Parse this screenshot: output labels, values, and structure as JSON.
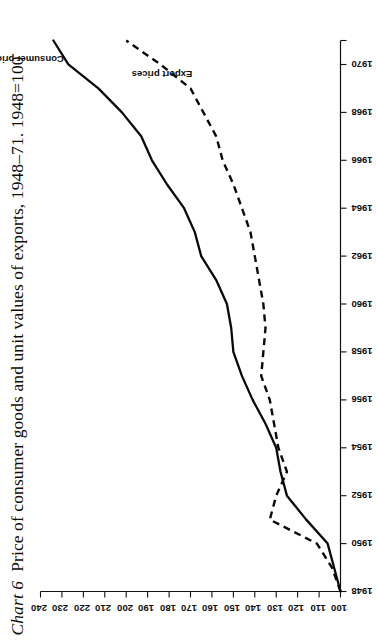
{
  "title": {
    "label": "Chart 6",
    "text": "Price of consumer goods and unit values of exports, 1948–71. 1948=100"
  },
  "series_labels": {
    "consumer": "Consumer prices",
    "export": "Export prices"
  },
  "axes": {
    "value_axis_ticks": [
      "240",
      "230",
      "220",
      "210",
      "200",
      "190",
      "180",
      "170",
      "160",
      "150",
      "140",
      "130",
      "120",
      "110",
      "100"
    ],
    "year_axis_ticks": [
      "1948",
      "1950",
      "1952",
      "1954",
      "1956",
      "1958",
      "1960",
      "1962",
      "1964",
      "1966",
      "1968",
      "1970"
    ]
  },
  "chart_data": {
    "type": "line",
    "xlabel": "",
    "ylabel": "",
    "index_base": "1948=100",
    "orientation": "rotated-90-landscape-scan",
    "grid": false,
    "legend": "inline-labels",
    "xlim": [
      1948,
      1971
    ],
    "ylim": [
      100,
      240
    ],
    "x": [
      1948,
      1949,
      1950,
      1951,
      1952,
      1953,
      1954,
      1955,
      1956,
      1957,
      1958,
      1959,
      1960,
      1961,
      1962,
      1963,
      1964,
      1965,
      1966,
      1967,
      1968,
      1969,
      1970,
      1971
    ],
    "series": [
      {
        "name": "Consumer prices",
        "style": "solid",
        "values": [
          100,
          103,
          106,
          116,
          125,
          128,
          130,
          135,
          141,
          146,
          150,
          151,
          153,
          158,
          165,
          168,
          173,
          181,
          188,
          193,
          202,
          213,
          227,
          234
        ]
      },
      {
        "name": "Export prices",
        "style": "dashed",
        "values": [
          100,
          104,
          111,
          133,
          130,
          125,
          129,
          131,
          133,
          137,
          136,
          135,
          136,
          138,
          140,
          142,
          146,
          150,
          155,
          158,
          164,
          170,
          184,
          200
        ]
      }
    ]
  }
}
